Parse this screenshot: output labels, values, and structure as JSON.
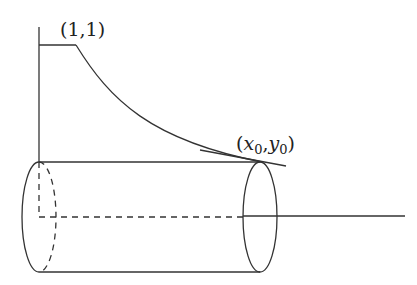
{
  "diagram": {
    "type": "solid-of-revolution",
    "labels": {
      "top_point": "(1,1)",
      "end_point_x": "x",
      "end_point_x_sub": "0",
      "end_point_sep": ",",
      "end_point_y": "y",
      "end_point_y_sub": "0",
      "end_open": "(",
      "end_close": ")"
    },
    "stroke_color": "#333333"
  }
}
